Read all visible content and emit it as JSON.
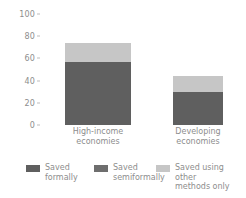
{
  "chart_data": {
    "type": "bar",
    "title": "",
    "subtitle": "",
    "xlabel": "",
    "ylabel": "",
    "ylim": [
      0,
      100
    ],
    "yticks": [
      0,
      20,
      40,
      60,
      80,
      100
    ],
    "ytick_labels": [
      "0",
      "20",
      "40",
      "60",
      "80",
      "100"
    ],
    "grid": false,
    "stacked": true,
    "legend_position": "bottom",
    "categories": [
      "High-income\neconomies",
      "Developing\neconomies"
    ],
    "series": [
      {
        "name": "Saved\nformally",
        "values": [
          57,
          30
        ],
        "color": "#5f5f5f"
      },
      {
        "name": "Saved\nsemiformally",
        "values": [
          0,
          0
        ],
        "color": "#6e6e6e"
      },
      {
        "name": "Saved using other\nmethods only",
        "values": [
          17,
          14
        ],
        "color": "#c6c6c6"
      }
    ],
    "totals": [
      74,
      44
    ]
  },
  "axis": {
    "tick_color": "#bdbdbd",
    "label_color": "#8d8d8d"
  },
  "legend": {
    "items": [
      {
        "label": "Saved\nformally",
        "color": "#5f5f5f"
      },
      {
        "label": "Saved\nsemiformally",
        "color": "#6e6e6e"
      },
      {
        "label": "Saved using other\nmethods only",
        "color": "#c6c6c6"
      }
    ]
  }
}
